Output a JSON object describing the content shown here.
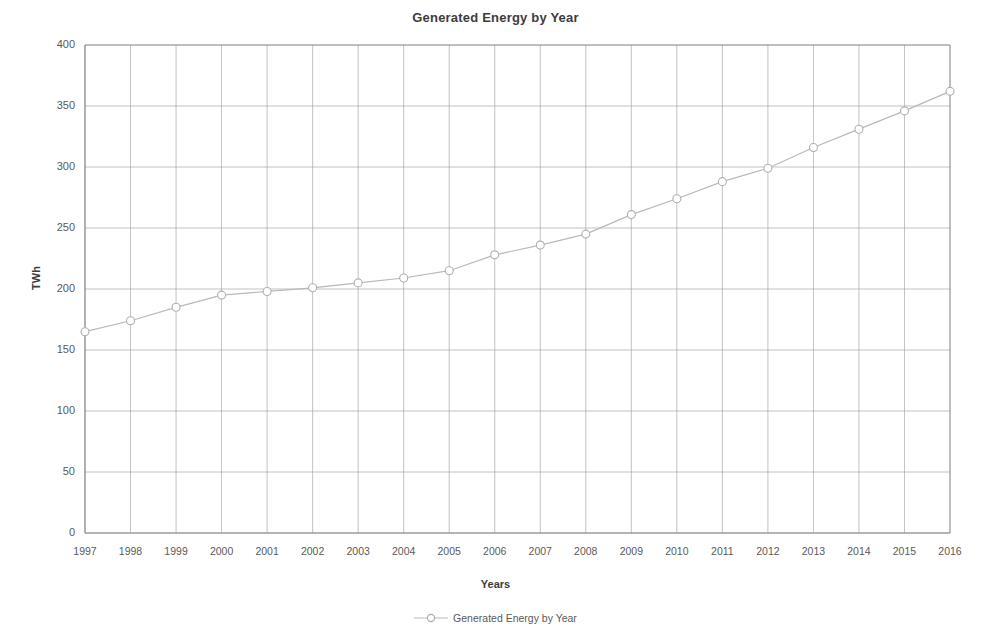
{
  "chart_data": {
    "type": "line",
    "title": "Generated Energy by Year",
    "xlabel": "Years",
    "ylabel": "TWh",
    "categories": [
      "1997",
      "1998",
      "1999",
      "2000",
      "2001",
      "2002",
      "2003",
      "2004",
      "2005",
      "2006",
      "2007",
      "2008",
      "2009",
      "2010",
      "2011",
      "2012",
      "2013",
      "2014",
      "2015",
      "2016"
    ],
    "values": [
      165,
      174,
      185,
      195,
      198,
      201,
      205,
      209,
      215,
      228,
      236,
      245,
      261,
      274,
      288,
      299,
      316,
      331,
      346,
      362
    ],
    "series": [
      {
        "name": "Generated Energy by Year",
        "values": [
          165,
          174,
          185,
          195,
          198,
          201,
          205,
          209,
          215,
          228,
          236,
          245,
          261,
          274,
          288,
          299,
          316,
          331,
          346,
          362
        ]
      }
    ],
    "ylim": [
      0,
      400
    ],
    "ytick_labels": [
      "0",
      "50",
      "100",
      "150",
      "200",
      "250",
      "300",
      "350",
      "400"
    ],
    "ytick_values": [
      0,
      50,
      100,
      150,
      200,
      250,
      300,
      350,
      400
    ],
    "xtick_labels": [
      "1997",
      "1998",
      "1999",
      "2000",
      "2001",
      "2002",
      "2003",
      "2004",
      "2005",
      "2006",
      "2007",
      "2008",
      "2009",
      "2010",
      "2011",
      "2012",
      "2013",
      "2014",
      "2015",
      "2016"
    ],
    "grid": true,
    "legend_position": "bottom",
    "marker": "circle-open",
    "line_color": "#b9b9b9",
    "marker_color": "#b0b0b0",
    "grid_color": "#9a9a9a",
    "axis_color": "#8a8a8a",
    "background_color": "#ffffff",
    "text_color": "#4a4a4a"
  },
  "legend": {
    "entries": [
      {
        "label": "Generated Energy by Year",
        "marker": "circle-open"
      }
    ]
  }
}
